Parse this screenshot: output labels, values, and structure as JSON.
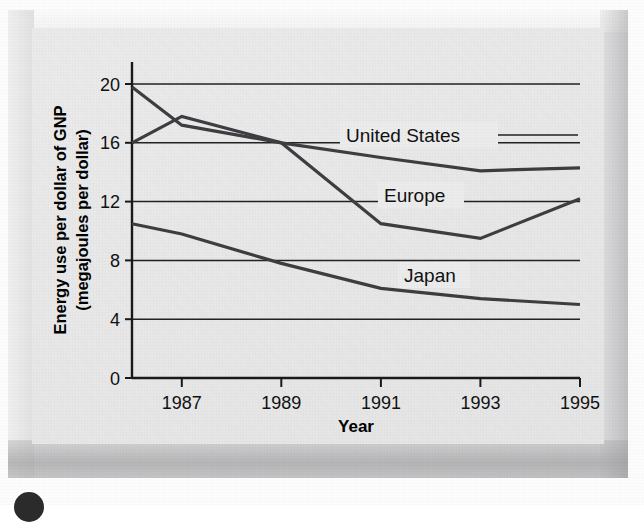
{
  "figure": {
    "background_color": "#ececed",
    "ink_color": "#222222",
    "line_color": "#3e3e42"
  },
  "chart_data": {
    "type": "line",
    "title": "",
    "subtitle": "",
    "xlabel": "Year",
    "ylabel": "Energy use per dollar of GNP (megajoules per dollar)",
    "ylabel_line1": "Energy use per dollar of GNP",
    "ylabel_line2": "(megajoules per dollar)",
    "x": [
      1986,
      1987,
      1989,
      1991,
      1993,
      1995
    ],
    "xlim": [
      1986,
      1995
    ],
    "ylim": [
      0,
      21.5
    ],
    "grid": "horizontal",
    "legend_position": "inline-labels",
    "xticks": [
      1987,
      1989,
      1991,
      1993,
      1995
    ],
    "xtick_labels": [
      "1987",
      "1989",
      "1991",
      "1993",
      "1995"
    ],
    "yticks": [
      0,
      4,
      8,
      12,
      16,
      20
    ],
    "ytick_labels": [
      "0",
      "4",
      "8",
      "12",
      "16",
      "20"
    ],
    "gridlines_at": [
      4,
      8,
      12,
      16,
      20
    ],
    "series": [
      {
        "name": "United States",
        "label": "United States",
        "values": [
          19.8,
          17.2,
          16.0,
          15.0,
          14.1,
          14.3
        ]
      },
      {
        "name": "Europe",
        "label": "Europe",
        "values": [
          16.0,
          17.8,
          16.0,
          10.5,
          9.5,
          12.2
        ]
      },
      {
        "name": "Japan",
        "label": "Japan",
        "values": [
          10.5,
          9.8,
          7.8,
          6.1,
          5.4,
          5.0
        ]
      }
    ]
  },
  "annotations": {
    "united_states_label": "United States",
    "europe_label": "Europe",
    "japan_label": "Japan"
  }
}
